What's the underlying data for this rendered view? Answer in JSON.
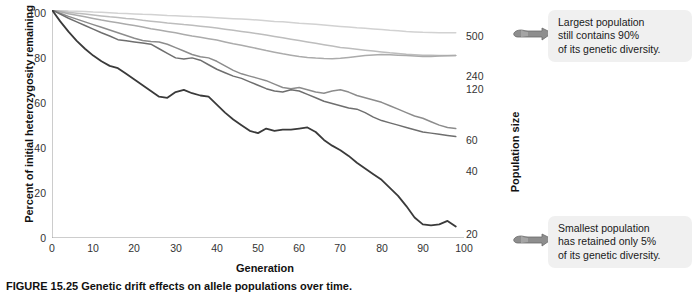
{
  "figure": {
    "caption": "FIGURE 15.25 Genetic drift effects on allele populations over time."
  },
  "axes": {
    "y_title": "Percent of initial heterozygosity remaining",
    "x_title": "Generation",
    "population_axis_title": "Population size",
    "y_ticks": [
      "0",
      "20",
      "40",
      "60",
      "80",
      "100"
    ],
    "x_ticks": [
      "0",
      "10",
      "20",
      "30",
      "40",
      "50",
      "60",
      "70",
      "80",
      "90",
      "100"
    ]
  },
  "callouts": {
    "largest": {
      "line1": "Largest population",
      "line2": "still contains 90%",
      "line3": "of its genetic diversity."
    },
    "smallest": {
      "line1": "Smallest population",
      "line2": "has retained only 5%",
      "line3": "of its genetic diversity."
    },
    "hand_icon_name": "pointing-hand-icon"
  },
  "series_labels": {
    "n500": "500",
    "n240": "240",
    "n120": "120",
    "n60": "60",
    "n40": "40",
    "n20": "20"
  },
  "chart_data": {
    "type": "line",
    "xlabel": "Generation",
    "ylabel": "Percent of initial heterozygosity remaining",
    "xlim": [
      0,
      100
    ],
    "ylim": [
      0,
      100
    ],
    "grid": false,
    "legend_position": "right-of-plot",
    "x": [
      0,
      2,
      4,
      6,
      8,
      10,
      12,
      14,
      16,
      18,
      20,
      22,
      24,
      26,
      28,
      30,
      32,
      34,
      36,
      38,
      40,
      42,
      44,
      46,
      48,
      50,
      52,
      54,
      56,
      58,
      60,
      62,
      64,
      66,
      68,
      70,
      72,
      74,
      76,
      78,
      80,
      82,
      84,
      86,
      88,
      90,
      92,
      94,
      96,
      98
    ],
    "series": [
      {
        "name": "500",
        "color": "#d2d2d2",
        "values": [
          100,
          99.8,
          99.6,
          99.5,
          99.3,
          99.1,
          99.0,
          98.8,
          98.6,
          98.5,
          98.3,
          98.1,
          98.0,
          97.8,
          97.6,
          97.5,
          97.3,
          97.1,
          97.0,
          96.8,
          96.6,
          96.4,
          96.2,
          96.0,
          95.8,
          95.6,
          95.3,
          95.0,
          94.8,
          94.5,
          94.2,
          94.0,
          93.7,
          93.4,
          93.1,
          92.8,
          92.5,
          92.2,
          92.0,
          91.7,
          91.4,
          91.1,
          90.9,
          90.6,
          90.4,
          90.2,
          90.1,
          90.0,
          90.0,
          90.0
        ]
      },
      {
        "name": "240",
        "color": "#bdbdbd",
        "values": [
          100,
          99.5,
          99.0,
          98.6,
          98.2,
          97.8,
          97.4,
          97.0,
          96.7,
          96.3,
          96.0,
          95.5,
          95.1,
          94.7,
          94.3,
          94.0,
          93.6,
          93.3,
          92.9,
          92.5,
          92.1,
          91.6,
          91.1,
          90.6,
          90.1,
          89.6,
          89.0,
          88.4,
          87.8,
          87.2,
          86.6,
          86.0,
          85.4,
          84.8,
          84.2,
          83.6,
          83.2,
          82.8,
          82.4,
          82.0,
          81.6,
          81.2,
          80.9,
          80.6,
          80.4,
          80.2,
          80.1,
          80.0,
          80.0,
          80.0
        ]
      },
      {
        "name": "120",
        "color": "#ababab",
        "values": [
          100,
          99.2,
          98.4,
          97.7,
          97.0,
          96.3,
          95.6,
          95.0,
          94.4,
          93.8,
          93.2,
          92.5,
          91.8,
          91.2,
          90.6,
          90.0,
          89.3,
          88.6,
          88.0,
          87.4,
          86.8,
          86.0,
          85.2,
          84.5,
          83.8,
          83.0,
          82.2,
          81.5,
          80.8,
          80.2,
          79.6,
          79.2,
          78.9,
          78.7,
          78.6,
          78.8,
          79.2,
          79.6,
          80.0,
          80.3,
          80.5,
          80.4,
          80.2,
          80.0,
          79.8,
          79.6,
          79.6,
          79.8,
          79.9,
          80.0
        ]
      },
      {
        "name": "60",
        "color": "#8c8c8c",
        "values": [
          100,
          98.6,
          97.2,
          96.0,
          94.8,
          93.6,
          92.4,
          91.2,
          90.0,
          88.8,
          87.6,
          86.6,
          86.2,
          86.0,
          85.0,
          83.5,
          82.0,
          80.5,
          79.5,
          79.0,
          77.5,
          75.5,
          73.5,
          72.0,
          71.0,
          70.0,
          69.0,
          67.5,
          66.0,
          65.5,
          66.0,
          65.0,
          64.0,
          63.5,
          64.5,
          65.0,
          64.0,
          62.5,
          61.5,
          60.5,
          59.5,
          58.0,
          56.5,
          55.0,
          53.5,
          52.5,
          51.0,
          49.5,
          48.5,
          48.0
        ]
      },
      {
        "name": "40",
        "color": "#6e6e6e",
        "values": [
          100,
          98.2,
          96.4,
          94.8,
          93.2,
          91.6,
          90.0,
          88.6,
          87.0,
          86.5,
          86.0,
          85.5,
          85.0,
          83.0,
          81.0,
          79.0,
          78.5,
          79.0,
          78.0,
          76.0,
          74.0,
          72.5,
          71.0,
          70.0,
          68.5,
          67.0,
          65.5,
          64.5,
          64.0,
          65.0,
          64.5,
          63.0,
          61.5,
          60.0,
          59.0,
          58.0,
          57.0,
          56.5,
          55.0,
          53.0,
          51.5,
          50.5,
          49.5,
          48.5,
          47.5,
          46.5,
          46.0,
          45.5,
          45.0,
          44.5
        ]
      },
      {
        "name": "20",
        "color": "#3a3a3a",
        "values": [
          100,
          95.0,
          90.5,
          86.5,
          83.0,
          80.0,
          77.5,
          75.5,
          74.5,
          72.0,
          69.5,
          67.0,
          64.5,
          62.0,
          61.5,
          64.0,
          65.0,
          63.5,
          62.5,
          62.0,
          58.5,
          55.0,
          52.0,
          49.5,
          47.0,
          46.0,
          48.0,
          47.0,
          47.5,
          47.5,
          48.0,
          48.5,
          46.5,
          43.0,
          40.5,
          38.5,
          36.0,
          33.0,
          30.5,
          28.0,
          25.5,
          22.0,
          18.5,
          14.0,
          9.0,
          6.0,
          5.5,
          6.0,
          7.5,
          5.0
        ]
      }
    ]
  }
}
